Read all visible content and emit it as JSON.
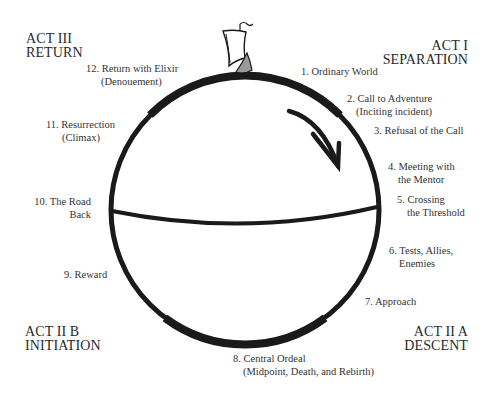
{
  "diagram": {
    "colors": {
      "ink": "#1a1a1a",
      "text": "#333333",
      "background": "#ffffff",
      "sail_shade": "#9a9a9a"
    },
    "acts": {
      "act1": {
        "line1": "ACT I",
        "line2": "SEPARATION"
      },
      "act2a": {
        "line1": "ACT II A",
        "line2": "DESCENT"
      },
      "act2b": {
        "line1": "ACT II B",
        "line2": "INITIATION"
      },
      "act3": {
        "line1": "ACT III",
        "line2": "RETURN"
      }
    },
    "stages": [
      {
        "line1": "1. Ordinary World",
        "line2": ""
      },
      {
        "line1": "2. Call to Adventure",
        "line2": "(Inciting incident)"
      },
      {
        "line1": "3. Refusal of the Call",
        "line2": ""
      },
      {
        "line1": "4. Meeting with",
        "line2": "the Mentor"
      },
      {
        "line1": "5. Crossing",
        "line2": "the Threshold"
      },
      {
        "line1": "6. Tests, Allies,",
        "line2": "Enemies"
      },
      {
        "line1": "7. Approach",
        "line2": ""
      },
      {
        "line1": "8. Central Ordeal",
        "line2": "(Midpoint, Death, and Rebirth)"
      },
      {
        "line1": "9. Reward",
        "line2": ""
      },
      {
        "line1": "10. The Road",
        "line2": "Back"
      },
      {
        "line1": "11. Resurrection",
        "line2": "(Climax)"
      },
      {
        "line1": "12. Return with Elixir",
        "line2": "(Denouement)"
      }
    ],
    "icons": {
      "ship": "ship-icon",
      "direction_arrow": "clockwise-arrow-icon"
    }
  }
}
